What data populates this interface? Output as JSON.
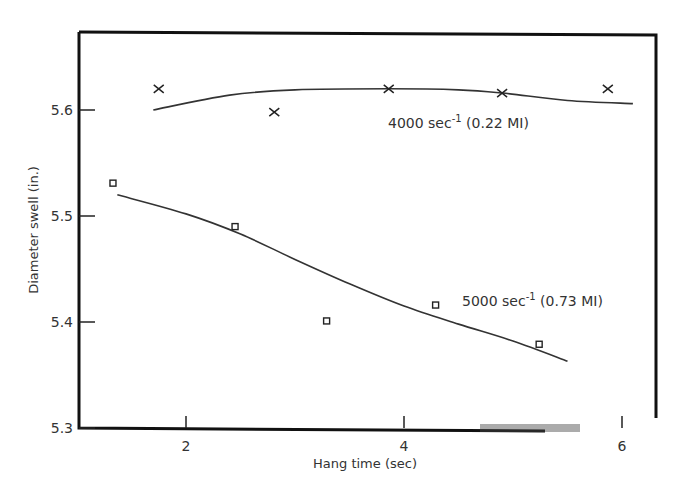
{
  "chart_data": {
    "type": "scatter",
    "title": "",
    "xlabel": "Hang time (sec)",
    "ylabel": "Diameter swell (in.)",
    "xlim": [
      1.0,
      6.3
    ],
    "ylim": [
      5.3,
      5.67
    ],
    "xticks": [
      2,
      4,
      6
    ],
    "yticks": [
      5.3,
      5.4,
      5.5,
      5.6
    ],
    "xtick_labels": [
      "2",
      "4",
      "6"
    ],
    "ytick_labels": [
      "5.3",
      "5.4",
      "5.5",
      "5.6"
    ],
    "grid": false,
    "legend": null,
    "series": [
      {
        "name": "4000 sec-1 (0.22 MI)",
        "marker": "x",
        "x": [
          1.75,
          2.81,
          3.86,
          4.9,
          5.87
        ],
        "y": [
          5.62,
          5.598,
          5.62,
          5.616,
          5.62
        ],
        "fit_curve": {
          "x": [
            1.7,
            2.4,
            3.0,
            3.86,
            4.5,
            4.9,
            5.5,
            6.1
          ],
          "y": [
            5.6,
            5.614,
            5.619,
            5.62,
            5.619,
            5.616,
            5.609,
            5.606
          ]
        }
      },
      {
        "name": "5000 sec-1 (0.73 MI)",
        "marker": "square",
        "x": [
          1.33,
          2.45,
          3.29,
          4.29,
          5.24
        ],
        "y": [
          5.531,
          5.49,
          5.401,
          5.416,
          5.379
        ],
        "fit_curve": {
          "x": [
            1.37,
            2.0,
            2.5,
            3.0,
            3.5,
            4.0,
            4.5,
            5.0,
            5.5
          ],
          "y": [
            5.52,
            5.502,
            5.483,
            5.459,
            5.436,
            5.415,
            5.398,
            5.382,
            5.363
          ]
        }
      }
    ],
    "annotations": [
      {
        "text": "4000 sec⁻¹ (0.22 MI)",
        "x": 4.2,
        "y": 5.594
      },
      {
        "text": "5000 sec⁻¹ (0.73 MI)",
        "x": 5.2,
        "y": 5.426
      }
    ]
  },
  "labels": {
    "ann1_main": "4000 sec",
    "ann1_sup": "-1",
    "ann1_tail": " (0.22 MI)",
    "ann2_main": "5000 sec",
    "ann2_sup": "-1",
    "ann2_tail": " (0.73 MI)"
  }
}
